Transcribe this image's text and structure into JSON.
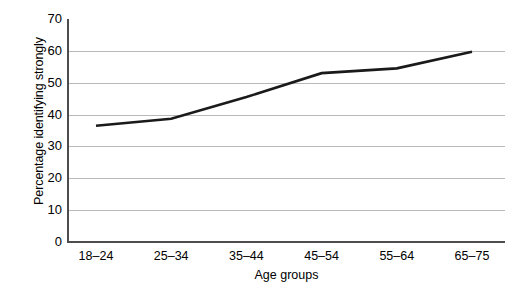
{
  "chart_data": {
    "type": "line",
    "title": "",
    "xlabel": "Age groups",
    "ylabel": "Percentage identifying strongly",
    "categories": [
      "18–24",
      "25–34",
      "35–44",
      "45–54",
      "55–64",
      "65–75"
    ],
    "values": [
      36.5,
      38.7,
      45.5,
      53.0,
      54.5,
      59.7
    ],
    "series": [
      {
        "name": "Percentage identifying strongly",
        "values": [
          36.5,
          38.7,
          45.5,
          53.0,
          54.5,
          59.7
        ]
      }
    ],
    "ylim": [
      0,
      70
    ],
    "yticks": [
      0,
      10,
      20,
      30,
      40,
      50,
      60,
      70
    ],
    "ytick_labels": [
      "0",
      "10",
      "20",
      "30",
      "40",
      "50",
      "60",
      "70"
    ],
    "grid": "horizontal",
    "legend": "none",
    "line_color": "#1a1a1a",
    "grid_color": "#b9b9b9",
    "axis_color": "#4d4d4d",
    "background": "#ffffff"
  }
}
